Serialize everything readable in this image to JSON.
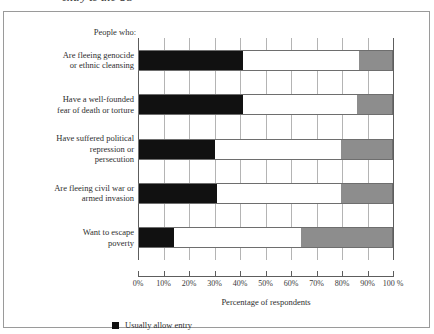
{
  "clipped_caption": "entry to the US",
  "chart_data": {
    "type": "bar",
    "subtype": "horizontal-stacked-100",
    "title": "",
    "xlabel": "Percentage of respondents",
    "ylabel": "",
    "category_header": "People who:",
    "categories": [
      "Are fleeing genocide\nor ethnic cleansing",
      "Have a well-founded\nfear of death or torture",
      "Have suffered political\nrepression or\npersecution",
      "Are fleeing civil war or\narmed invasion",
      "Want to escape\npoverty"
    ],
    "category_lines": [
      [
        "Are fleeing genocide",
        "or ethnic cleansing"
      ],
      [
        "Have a well-founded",
        "fear of death or torture"
      ],
      [
        "Have suffered political",
        "repression or",
        "persecution"
      ],
      [
        "Are fleeing civil war or",
        "armed invasion"
      ],
      [
        "Want to escape",
        "poverty"
      ]
    ],
    "series": [
      {
        "name": "Usually allow entry",
        "color": "#111111",
        "values": [
          41,
          41,
          30,
          31,
          14
        ]
      },
      {
        "name": "",
        "color": "#ffffff",
        "values": [
          46,
          45,
          50,
          49,
          50
        ]
      },
      {
        "name": "",
        "color": "#8d8d8d",
        "values": [
          13,
          14,
          20,
          20,
          36
        ]
      }
    ],
    "xlim": [
      0,
      100
    ],
    "xticks": [
      0,
      10,
      20,
      30,
      40,
      50,
      60,
      70,
      80,
      90,
      100
    ],
    "xtick_labels": [
      "0%",
      "10%",
      "20%",
      "30%",
      "40%",
      "50%",
      "60%",
      "70%",
      "80%",
      "90%",
      "100 %"
    ],
    "grid": true,
    "grid_axis": "x",
    "legend_position": "bottom-left",
    "legend": [
      {
        "label": "Usually allow entry",
        "color": "#111111"
      }
    ]
  }
}
